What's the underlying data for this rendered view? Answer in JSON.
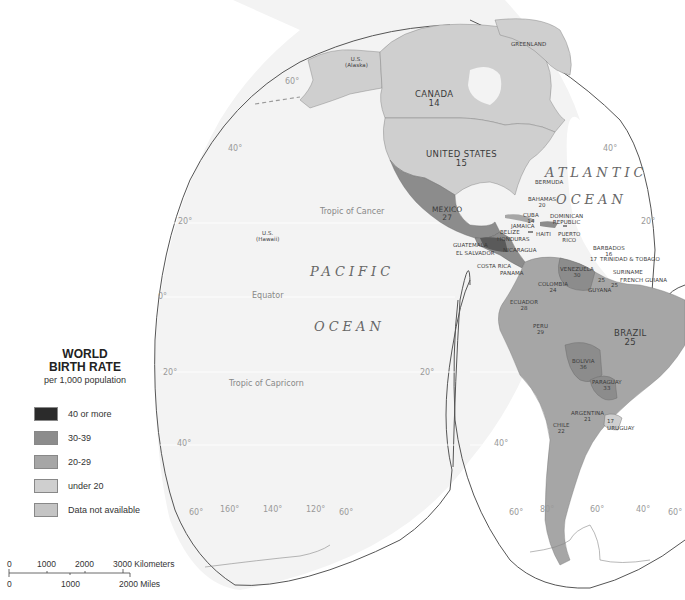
{
  "legend": {
    "title_line1": "WORLD",
    "title_line2": "BIRTH RATE",
    "subtitle": "per 1,000 population",
    "items": [
      {
        "label": "40 or more",
        "color": "#2b2b2b"
      },
      {
        "label": "30-39",
        "color": "#8c8c8c"
      },
      {
        "label": "20-29",
        "color": "#a6a6a6"
      },
      {
        "label": "under 20",
        "color": "#cfcfcf"
      },
      {
        "label": "Data not available",
        "color": "#c4c4c4"
      }
    ]
  },
  "scale": {
    "km_ticks": [
      "0",
      "1000",
      "2000",
      "3000 Kilometers"
    ],
    "mi_ticks": [
      "0",
      "1000",
      "2000 Miles"
    ]
  },
  "oceans": {
    "pacific_1": "PACIFIC",
    "pacific_2": "OCEAN",
    "atlantic_1": "ATLANTIC",
    "atlantic_2": "OCEAN"
  },
  "lines": {
    "tropic_cancer": "Tropic of Cancer",
    "equator": "Equator",
    "tropic_capricorn": "Tropic of Capricorn"
  },
  "degrees": {
    "left_lobe": [
      "60°",
      "40°",
      "20°",
      "0°",
      "20°",
      "40°",
      "60°"
    ],
    "bottom_left": [
      "60°",
      "160°",
      "140°",
      "120°",
      "60°"
    ],
    "right_lobe": [
      "40°",
      "20°",
      "20°",
      "40°"
    ],
    "bottom_right": [
      "60°",
      "80°",
      "60°",
      "40°",
      "60°"
    ]
  },
  "countries": {
    "alaska": {
      "name": "U.S.",
      "sub": "(Alaska)"
    },
    "hawaii": {
      "name": "U.S.",
      "sub": "(Hawaii)"
    },
    "greenland": {
      "name": "GREENLAND"
    },
    "canada": {
      "name": "CANADA",
      "rate": "14"
    },
    "united_states": {
      "name": "UNITED STATES",
      "rate": "15"
    },
    "mexico": {
      "name": "MEXICO",
      "rate": "27"
    },
    "bermuda": {
      "name": "BERMUDA"
    },
    "bahamas": {
      "name": "BAHAMAS",
      "rate": "20"
    },
    "cuba": {
      "name": "CUBA",
      "rate": "14"
    },
    "jamaica": {
      "name": "JAMAICA"
    },
    "haiti": {
      "name": "HAITI"
    },
    "dominican_republic": {
      "name": "DOMINICAN",
      "name2": "REPUBLIC"
    },
    "puerto_rico": {
      "name": "PUERTO",
      "name2": "RICO"
    },
    "belize": {
      "name": "BELIZE"
    },
    "honduras": {
      "name": "HONDURAS"
    },
    "guatemala": {
      "name": "GUATEMALA"
    },
    "el_salvador": {
      "name": "EL SALVADOR"
    },
    "nicaragua": {
      "name": "NICARAGUA"
    },
    "costa_rica": {
      "name": "COSTA RICA"
    },
    "panama": {
      "name": "PANAMA"
    },
    "barbados": {
      "name": "BARBADOS",
      "rate": "16"
    },
    "trinidad": {
      "name": "TRINIDAD & TOBAGO",
      "rate": "17"
    },
    "venezuela": {
      "name": "VENEZUELA",
      "rate": "30"
    },
    "colombia": {
      "name": "COLOMBIA",
      "rate": "24"
    },
    "suriname": {
      "name": "SURINAME",
      "rate": "25"
    },
    "french_guiana": {
      "name": "FRENCH GUIANA"
    },
    "guyana": {
      "name": "GUYANA",
      "rate": "25"
    },
    "ecuador": {
      "name": "ECUADOR",
      "rate": "28"
    },
    "peru": {
      "name": "PERU",
      "rate": "29"
    },
    "brazil": {
      "name": "BRAZIL",
      "rate": "25"
    },
    "bolivia": {
      "name": "BOLIVIA",
      "rate": "36"
    },
    "paraguay": {
      "name": "PARAGUAY",
      "rate": "33"
    },
    "argentina": {
      "name": "ARGENTINA",
      "rate": "21"
    },
    "chile": {
      "name": "CHILE",
      "rate": "22"
    },
    "uruguay": {
      "name": "URUGUAY",
      "rate": "17"
    }
  },
  "colors": {
    "ocean": "#f2f2f2",
    "outline": "#555555",
    "rate_14_19": "#cfcfcf",
    "rate_20_29": "#a6a6a6",
    "rate_30_39": "#8c8c8c",
    "rate_40_plus": "#2b2b2b"
  }
}
